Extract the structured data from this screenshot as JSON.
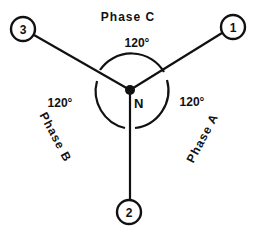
{
  "diagram": {
    "neutral_label": "N",
    "terminals": [
      {
        "id": "1",
        "label": "1"
      },
      {
        "id": "2",
        "label": "2"
      },
      {
        "id": "3",
        "label": "3"
      }
    ],
    "phases": [
      {
        "name": "Phase A",
        "label": "Phase A",
        "between": [
          "1",
          "2"
        ]
      },
      {
        "name": "Phase B",
        "label": "Phase B",
        "between": [
          "2",
          "3"
        ]
      },
      {
        "name": "Phase C",
        "label": "Phase C",
        "between": [
          "3",
          "1"
        ]
      }
    ],
    "angles": {
      "top": "120°",
      "left": "120°",
      "right": "120°"
    },
    "colors": {
      "line": "#111111",
      "background": "#ffffff"
    }
  }
}
